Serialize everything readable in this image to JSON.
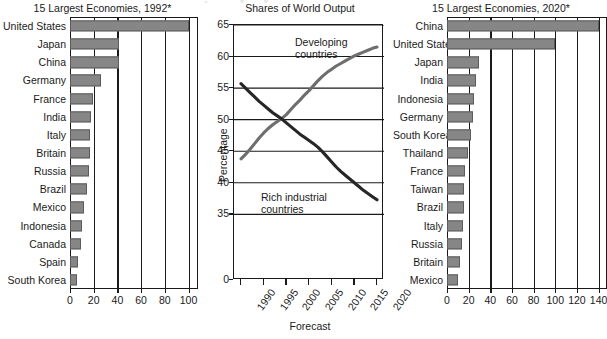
{
  "figure": {
    "panels": [
      "left-bar-1992",
      "middle-line-shares",
      "right-bar-2020"
    ]
  },
  "chart_data": [
    {
      "type": "bar",
      "orientation": "horizontal",
      "title": "15 Largest Economies, 1992*",
      "xlabel": "",
      "ylabel": "",
      "xlim": [
        0,
        108
      ],
      "xticks": [
        0,
        20,
        40,
        60,
        80,
        100
      ],
      "xticklabels": [
        "0",
        "20",
        "40",
        "60",
        "80",
        "100"
      ],
      "grid": "vertical",
      "categories": [
        "United States",
        "Japan",
        "China",
        "Germany",
        "France",
        "India",
        "Italy",
        "Britain",
        "Russia",
        "Brazil",
        "Mexico",
        "Indonesia",
        "Canada",
        "Spain",
        "South Korea"
      ],
      "values": [
        100,
        41,
        41,
        26,
        19,
        18,
        17,
        17,
        16,
        14,
        12,
        10,
        9,
        7,
        6
      ],
      "bar_color": "#868686"
    },
    {
      "type": "line",
      "title": "Shares of World Output",
      "xlabel": "Forecast",
      "ylabel": "Percentage",
      "xlim": [
        1990,
        2020
      ],
      "ylim": [
        0,
        65
      ],
      "yticks": [
        0,
        35,
        40,
        45,
        50,
        55,
        60,
        65
      ],
      "yticklabels": [
        "0",
        "35",
        "40",
        "45",
        "50",
        "55",
        "60",
        "65"
      ],
      "xticks": [
        1990,
        1995,
        2000,
        2005,
        2010,
        2015,
        2020
      ],
      "xticklabels": [
        "1990",
        "1995",
        "2000",
        "2005",
        "2010",
        "2015",
        "2020"
      ],
      "grid": "horizontal",
      "x": [
        1990,
        1991,
        1992,
        1993,
        1994,
        1995,
        1996,
        1997,
        1998,
        1999,
        2000,
        2001,
        2002,
        2003,
        2004,
        2005,
        2006,
        2007,
        2008,
        2009,
        2010,
        2011,
        2012,
        2013,
        2014,
        2015,
        2016,
        2017,
        2018,
        2019,
        2020
      ],
      "series": [
        {
          "name": "Developing countries",
          "annotation": "Developing countries",
          "values": [
            43.8,
            44.5,
            45.3,
            46.2,
            47.1,
            47.9,
            48.6,
            49.2,
            49.7,
            50.2,
            50.8,
            51.6,
            52.4,
            53.1,
            53.9,
            54.6,
            55.4,
            56.2,
            56.9,
            57.5,
            58.0,
            58.5,
            58.9,
            59.3,
            59.7,
            60.1,
            60.4,
            60.7,
            61.0,
            61.3,
            61.5
          ]
        },
        {
          "name": "Rich industrial countries",
          "annotation": "Rich industrial countries",
          "values": [
            55.7,
            55.0,
            54.3,
            53.6,
            52.9,
            52.3,
            51.7,
            51.1,
            50.6,
            50.1,
            49.5,
            48.9,
            48.3,
            47.7,
            47.2,
            46.7,
            46.2,
            45.6,
            44.9,
            44.1,
            43.3,
            42.5,
            41.8,
            41.2,
            40.6,
            40.0,
            39.4,
            38.8,
            38.3,
            37.8,
            37.3
          ]
        }
      ]
    },
    {
      "type": "bar",
      "orientation": "horizontal",
      "title": "15 Largest Economies, 2020*",
      "xlabel": "",
      "ylabel": "",
      "xlim": [
        0,
        148
      ],
      "xticks": [
        0,
        20,
        40,
        60,
        80,
        100,
        120,
        140
      ],
      "xticklabels": [
        "0",
        "20",
        "40",
        "60",
        "80",
        "100",
        "120",
        "140"
      ],
      "grid": "vertical",
      "categories": [
        "China",
        "United States",
        "Japan",
        "India",
        "Indonesia",
        "Germany",
        "South Korea",
        "Thailand",
        "France",
        "Taiwan",
        "Brazil",
        "Italy",
        "Russia",
        "Britain",
        "Mexico"
      ],
      "values": [
        140,
        100,
        30,
        27,
        25,
        24,
        22,
        19,
        17,
        16,
        16,
        15,
        14,
        12,
        10
      ],
      "bar_color": "#868686"
    }
  ],
  "left_chart": {
    "title": "15 Largest Economies, 1992*",
    "xticklabels": [
      "0",
      "20",
      "40",
      "60",
      "80",
      "100"
    ],
    "rows": [
      {
        "label": "United States",
        "value": 100
      },
      {
        "label": "Japan",
        "value": 41
      },
      {
        "label": "China",
        "value": 41
      },
      {
        "label": "Germany",
        "value": 26
      },
      {
        "label": "France",
        "value": 19
      },
      {
        "label": "India",
        "value": 18
      },
      {
        "label": "Italy",
        "value": 17
      },
      {
        "label": "Britain",
        "value": 17
      },
      {
        "label": "Russia",
        "value": 16
      },
      {
        "label": "Brazil",
        "value": 14
      },
      {
        "label": "Mexico",
        "value": 12
      },
      {
        "label": "Indonesia",
        "value": 10
      },
      {
        "label": "Canada",
        "value": 9
      },
      {
        "label": "Spain",
        "value": 7
      },
      {
        "label": "South Korea",
        "value": 6
      }
    ]
  },
  "middle_chart": {
    "title": "Shares of World Output",
    "ylabel": "Percentage",
    "xlabel": "Forecast",
    "yticklabels": [
      "65",
      "60",
      "55",
      "50",
      "45",
      "40",
      "35",
      "0"
    ],
    "xticklabels": [
      "1990",
      "1995",
      "2000",
      "2005",
      "2010",
      "2015",
      "2020"
    ],
    "annotation_top_line1": "Developing",
    "annotation_top_line2": "countries",
    "annotation_bottom_line1": "Rich industrial",
    "annotation_bottom_line2": "countries"
  },
  "right_chart": {
    "title": "15 Largest Economies, 2020*",
    "xticklabels": [
      "0",
      "20",
      "40",
      "60",
      "80",
      "100",
      "120",
      "140"
    ],
    "rows": [
      {
        "label": "China",
        "value": 140
      },
      {
        "label": "United States",
        "value": 100
      },
      {
        "label": "Japan",
        "value": 30
      },
      {
        "label": "India",
        "value": 27
      },
      {
        "label": "Indonesia",
        "value": 25
      },
      {
        "label": "Germany",
        "value": 24
      },
      {
        "label": "South Korea",
        "value": 22
      },
      {
        "label": "Thailand",
        "value": 19
      },
      {
        "label": "France",
        "value": 17
      },
      {
        "label": "Taiwan",
        "value": 16
      },
      {
        "label": "Brazil",
        "value": 16
      },
      {
        "label": "Italy",
        "value": 15
      },
      {
        "label": "Russia",
        "value": 14
      },
      {
        "label": "Britain",
        "value": 12
      },
      {
        "label": "Mexico",
        "value": 10
      }
    ]
  }
}
